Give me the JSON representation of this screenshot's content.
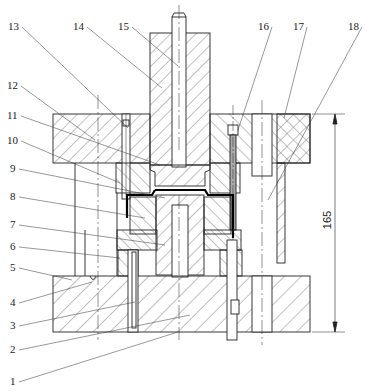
{
  "drawing": {
    "type": "die assembly cross-section",
    "dimension": {
      "value": "165",
      "x": 335,
      "y1": 114,
      "y2": 332
    }
  },
  "labels": [
    {
      "id": "1",
      "text": "1",
      "x": 10,
      "y": 376,
      "tx": 178,
      "ty": 332
    },
    {
      "id": "2",
      "text": "2",
      "x": 10,
      "y": 344,
      "tx": 190,
      "ty": 315
    },
    {
      "id": "3",
      "text": "3",
      "x": 10,
      "y": 320,
      "tx": 135,
      "ty": 302
    },
    {
      "id": "4",
      "text": "4",
      "x": 10,
      "y": 297,
      "tx": 92,
      "ty": 282
    },
    {
      "id": "5",
      "text": "5",
      "x": 10,
      "y": 262,
      "tx": 72,
      "ty": 280
    },
    {
      "id": "6",
      "text": "6",
      "x": 10,
      "y": 241,
      "tx": 120,
      "ty": 258
    },
    {
      "id": "7",
      "text": "7",
      "x": 10,
      "y": 219,
      "tx": 165,
      "ty": 245
    },
    {
      "id": "8",
      "text": "8",
      "x": 10,
      "y": 191,
      "tx": 145,
      "ty": 218
    },
    {
      "id": "9",
      "text": "9",
      "x": 10,
      "y": 163,
      "tx": 165,
      "ty": 198
    },
    {
      "id": "10",
      "text": "10",
      "x": 7,
      "y": 135,
      "tx": 120,
      "ty": 183
    },
    {
      "id": "11",
      "text": "11",
      "x": 7,
      "y": 110,
      "tx": 160,
      "ty": 165
    },
    {
      "id": "12",
      "text": "12",
      "x": 7,
      "y": 80,
      "tx": 95,
      "ty": 140
    },
    {
      "id": "13",
      "text": "13",
      "x": 8,
      "y": 21,
      "tx": 128,
      "ty": 128
    },
    {
      "id": "14",
      "text": "14",
      "x": 73,
      "y": 21,
      "tx": 162,
      "ty": 88
    },
    {
      "id": "15",
      "text": "15",
      "x": 118,
      "y": 21,
      "tx": 178,
      "ty": 66
    },
    {
      "id": "16",
      "text": "16",
      "x": 258,
      "y": 21,
      "tx": 238,
      "ty": 130
    },
    {
      "id": "17",
      "text": "17",
      "x": 293,
      "y": 21,
      "tx": 284,
      "ty": 118
    },
    {
      "id": "18",
      "text": "18",
      "x": 348,
      "y": 21,
      "tx": 268,
      "ty": 200
    }
  ]
}
